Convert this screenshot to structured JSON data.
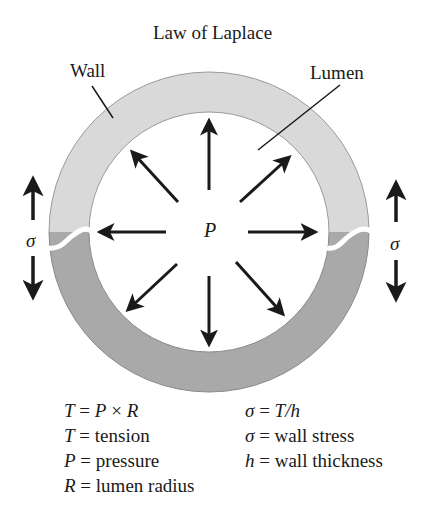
{
  "title": "Law of Laplace",
  "labels": {
    "wall": "Wall",
    "lumen": "Lumen",
    "pressure": "P",
    "stress_left": "σ",
    "stress_right": "σ"
  },
  "colors": {
    "wall_top": "#d9d9d9",
    "wall_bottom": "#a9a9a9",
    "arrow": "#1a1a1a",
    "background": "#ffffff"
  },
  "equations_left": [
    {
      "sym": "T",
      "eq": " = ",
      "rhs_sym": "P",
      "rhs": " × ",
      "rhs_sym2": "R"
    },
    {
      "sym": "T",
      "eq": " = ",
      "rhs": "tension"
    },
    {
      "sym": "P",
      "eq": " = ",
      "rhs": "pressure"
    },
    {
      "sym": "R",
      "eq": " = ",
      "rhs": "lumen radius"
    }
  ],
  "equations_right": [
    {
      "sym": "σ",
      "eq": " = ",
      "rhs_sym": "T/h"
    },
    {
      "sym": "σ",
      "eq": " = ",
      "rhs": "wall stress"
    },
    {
      "sym": "h",
      "eq": " = ",
      "rhs": "wall thickness"
    }
  ]
}
